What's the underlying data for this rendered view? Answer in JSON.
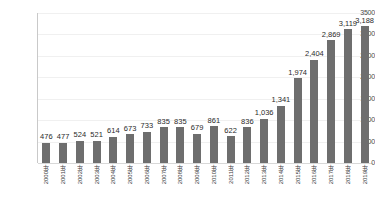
{
  "chart_data": {
    "type": "bar",
    "title": "",
    "xlabel": "",
    "ylabel": "",
    "ylim": [
      0,
      3500
    ],
    "yticks": [
      0,
      500,
      1000,
      1500,
      2000,
      2500,
      3000,
      3500
    ],
    "ytick_labels": [
      "0",
      "500",
      "1000",
      "1500",
      "2000",
      "2500",
      "3000",
      "3500"
    ],
    "grid": true,
    "legend": null,
    "bar_color": "#6e6e6e",
    "categories": [
      "2000年",
      "2001年",
      "2002年",
      "2003年",
      "2004年",
      "2005年",
      "2006年",
      "2007年",
      "2008年",
      "2009年",
      "2010年",
      "2011年",
      "2012年",
      "2013年",
      "2014年",
      "2015年",
      "2016年",
      "2017年",
      "2018年",
      "2019年"
    ],
    "values": [
      476,
      477,
      524,
      521,
      614,
      673,
      733,
      835,
      835,
      679,
      861,
      622,
      836,
      1036,
      1341,
      1974,
      2404,
      2869,
      3119,
      3188
    ],
    "value_labels": [
      "476",
      "477",
      "524",
      "521",
      "614",
      "673",
      "733",
      "835",
      "835",
      "679",
      "861",
      "622",
      "836",
      "1,036",
      "1,341",
      "1,974",
      "2,404",
      "2,869",
      "3,119",
      "3,188"
    ]
  }
}
